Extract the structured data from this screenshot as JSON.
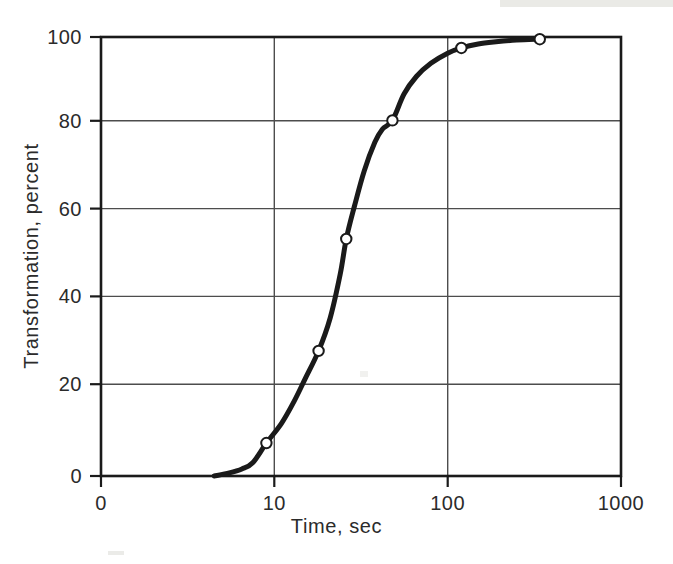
{
  "chart_data": {
    "type": "line",
    "title": "",
    "xlabel": "Time, sec",
    "ylabel": "Transformation, percent",
    "xscale": "log",
    "yscale": "linear",
    "xlim": [
      1,
      1000
    ],
    "ylim": [
      0,
      100
    ],
    "grid": true,
    "legend": null,
    "xticks": [
      {
        "value": 1,
        "label": "0"
      },
      {
        "value": 10,
        "label": "10"
      },
      {
        "value": 100,
        "label": "100"
      },
      {
        "value": 1000,
        "label": "1000"
      }
    ],
    "yticks": [
      {
        "value": 0,
        "label": "0"
      },
      {
        "value": 20,
        "label": "20"
      },
      {
        "value": 40,
        "label": "40"
      },
      {
        "value": 60,
        "label": "60"
      },
      {
        "value": 80,
        "label": "80"
      },
      {
        "value": 100,
        "label": "100"
      }
    ],
    "series": [
      {
        "name": "Transformation",
        "marker": "open-circle",
        "line_color": "#1a1a1a",
        "marker_face": "#ffffff",
        "x": [
          9,
          18,
          26,
          48,
          120,
          340
        ],
        "y": [
          7.5,
          28.5,
          54,
          81,
          97.5,
          99.5
        ],
        "curve_x": [
          4.5,
          5.5,
          6.5,
          7.5,
          9,
          11,
          13,
          15,
          18,
          21,
          24,
          26,
          29,
          33,
          38,
          42,
          48,
          56,
          66,
          80,
          100,
          120,
          150,
          190,
          250,
          340
        ],
        "curve_y": [
          0,
          0.7,
          1.6,
          3.0,
          7.5,
          12.0,
          17.0,
          22.0,
          28.5,
          36.0,
          46.0,
          54.0,
          61.5,
          69.5,
          76.0,
          79.0,
          81.0,
          87.0,
          91.0,
          94.0,
          96.3,
          97.5,
          98.4,
          98.9,
          99.3,
          99.5
        ]
      }
    ],
    "axis_color": "#1a1a1a",
    "grid_color": "#4d4d4d",
    "background": "#ffffff"
  },
  "axes": {
    "x_tick_labels": [
      "0",
      "10",
      "100",
      "1000"
    ],
    "y_tick_labels": [
      "0",
      "20",
      "40",
      "60",
      "80",
      "100"
    ],
    "x_title": "Time, sec",
    "y_title": "Transformation, percent"
  }
}
